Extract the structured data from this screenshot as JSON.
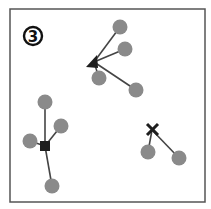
{
  "figure": {
    "panel_label": "3",
    "colors": {
      "frame": "#555555",
      "edge": "#444444",
      "node": "#8a8a8a",
      "hub": "#1e1e1e"
    },
    "clusters": [
      {
        "name": "triangle-cluster",
        "hub_shape": "triangle",
        "hub": [
          94,
          62
        ],
        "nodes": [
          [
            120,
            27
          ],
          [
            125,
            49
          ],
          [
            99,
            78
          ],
          [
            136,
            90
          ]
        ]
      },
      {
        "name": "square-cluster",
        "hub_shape": "square",
        "hub": [
          45,
          146
        ],
        "nodes": [
          [
            45,
            102
          ],
          [
            61,
            126
          ],
          [
            30,
            141
          ],
          [
            52,
            186
          ]
        ]
      },
      {
        "name": "cross-cluster",
        "hub_shape": "cross",
        "hub": [
          152,
          130
        ],
        "nodes": [
          [
            148,
            152
          ],
          [
            179,
            158
          ]
        ]
      }
    ]
  }
}
